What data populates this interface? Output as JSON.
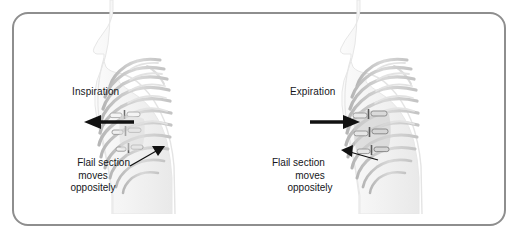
{
  "figure": {
    "frame": {
      "border_color": "#8e8e8e",
      "background_color": "#ffffff",
      "corner_radius_px": 16
    },
    "colors": {
      "body_fill": "#f6f6f6",
      "body_edge": "#e2e2e2",
      "rib_light": "#d6d6d6",
      "rib_mid": "#bfbfbf",
      "rib_dark": "#9a9a9a",
      "flail_patch": "#cccccc",
      "text": "#15161a",
      "arrow": "#111111"
    }
  },
  "panels": [
    {
      "id": "inspiration",
      "phase_label": "Inspiration",
      "arrow_direction": "left",
      "callout": {
        "line1": "Flail section",
        "line2": "moves",
        "line3": "oppositely"
      },
      "leader_direction": "up-right"
    },
    {
      "id": "expiration",
      "phase_label": "Expiration",
      "arrow_direction": "right",
      "callout": {
        "line1": "Flail section",
        "line2": "moves",
        "line3": "oppositely"
      },
      "leader_direction": "up-right"
    }
  ]
}
